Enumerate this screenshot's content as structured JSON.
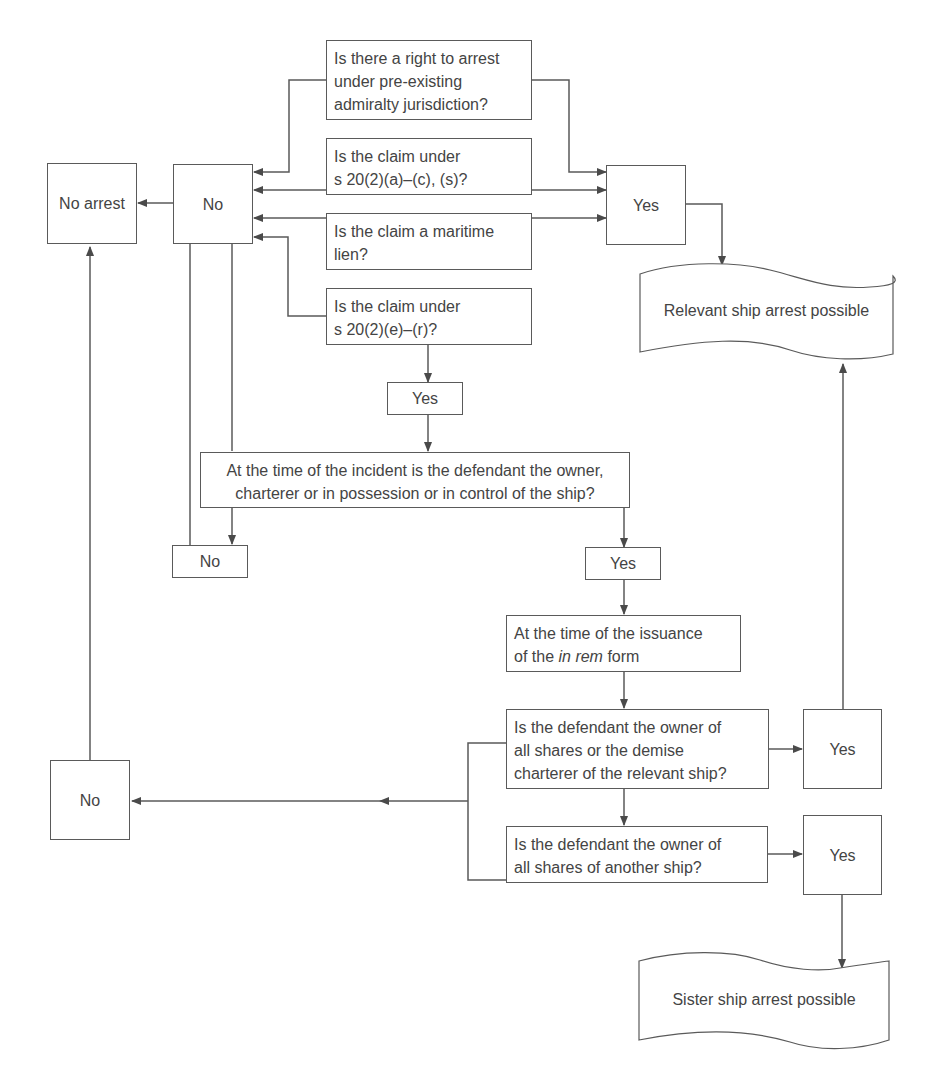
{
  "diagram": {
    "type": "flowchart",
    "topic": "Ship arrest decision process",
    "nodes": {
      "q_preexisting": {
        "lines": [
          "Is there a right to arrest",
          "under pre-existing",
          "admiralty jurisdiction?"
        ]
      },
      "q_s20_ac": {
        "lines": [
          "Is the claim under",
          "s 20(2)(a)–(c), (s)?"
        ]
      },
      "q_maritime_lien": {
        "lines": [
          "Is the claim a maritime",
          "lien?"
        ]
      },
      "q_s20_er": {
        "lines": [
          "Is the claim under",
          "s 20(2)(e)–(r)?"
        ]
      },
      "no_top": {
        "label": "No"
      },
      "no_arrest": {
        "label": "No arrest"
      },
      "yes_top": {
        "label": "Yes"
      },
      "relevant_ship": {
        "label": "Relevant ship arrest possible"
      },
      "yes_after_er": {
        "label": "Yes"
      },
      "q_incident": {
        "lines": [
          "At the time of the incident is the defendant the owner,",
          "charterer or in possession or in control of the ship?"
        ]
      },
      "no_incident": {
        "label": "No"
      },
      "yes_incident": {
        "label": "Yes"
      },
      "issuance": {
        "line1": "At the time of the issuance",
        "line2_pre": "of the ",
        "line2_italic": "in rem",
        "line2_post": " form"
      },
      "q_demise": {
        "lines": [
          "Is the defendant the owner of",
          "all shares or the demise",
          "charterer of the relevant ship?"
        ]
      },
      "yes_demise": {
        "label": "Yes"
      },
      "no_bottom": {
        "label": "No"
      },
      "q_another": {
        "lines": [
          "Is the defendant the owner of",
          "all shares of another ship?"
        ]
      },
      "yes_another": {
        "label": "Yes"
      },
      "sister_ship": {
        "label": "Sister ship arrest possible"
      }
    },
    "colors": {
      "stroke": "#5a5a5a",
      "text": "#444444",
      "background": "#ffffff"
    }
  }
}
